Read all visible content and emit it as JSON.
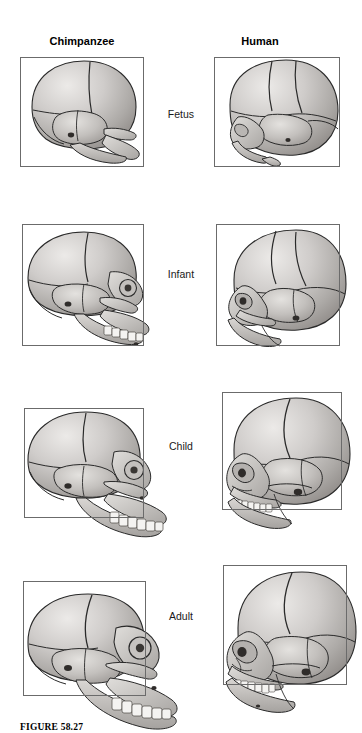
{
  "figure": {
    "caption": "FIGURE 58.27",
    "columns": [
      {
        "id": "chimpanzee",
        "label": "Chimpanzee"
      },
      {
        "id": "human",
        "label": "Human"
      }
    ],
    "rows": [
      {
        "id": "fetus",
        "label": "Fetus"
      },
      {
        "id": "infant",
        "label": "Infant"
      },
      {
        "id": "child",
        "label": "Child"
      },
      {
        "id": "adult",
        "label": "Adult"
      }
    ],
    "colors": {
      "box_stroke": "#6b6b6b",
      "bone_outline": "#2a2a2a",
      "bone_light": "#e6e4e2",
      "bone_mid": "#bdbab7",
      "bone_shadow": "#8e8b88",
      "tooth": "#f4f3f1",
      "background": "#ffffff"
    },
    "panels": [
      {
        "row": "fetus",
        "column": "chimpanzee",
        "alt": "chimpanzee-fetus-skull-lateral"
      },
      {
        "row": "fetus",
        "column": "human",
        "alt": "human-fetus-skull-lateral"
      },
      {
        "row": "infant",
        "column": "chimpanzee",
        "alt": "chimpanzee-infant-skull-lateral"
      },
      {
        "row": "infant",
        "column": "human",
        "alt": "human-infant-skull-lateral"
      },
      {
        "row": "child",
        "column": "chimpanzee",
        "alt": "chimpanzee-child-skull-lateral"
      },
      {
        "row": "child",
        "column": "human",
        "alt": "human-child-skull-lateral"
      },
      {
        "row": "adult",
        "column": "chimpanzee",
        "alt": "chimpanzee-adult-skull-lateral"
      },
      {
        "row": "adult",
        "column": "human",
        "alt": "human-adult-skull-lateral"
      }
    ]
  }
}
